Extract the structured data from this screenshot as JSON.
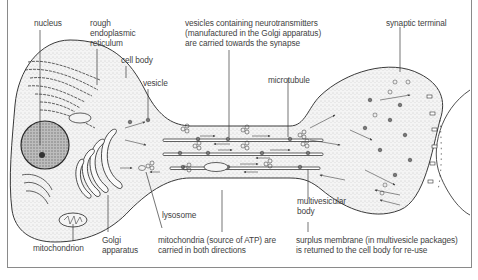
{
  "diagram": {
    "labels": {
      "nucleus": "nucleus",
      "rer_line1": "rough",
      "rer_line2": "endoplasmic",
      "rer_line3": "reticulum",
      "cell_body": "cell body",
      "vesicle": "vesicle",
      "vesicles_line1": "vesicles containing neurotransmitters",
      "vesicles_line2": "(manufactured in the Golgi apparatus)",
      "vesicles_line3": "are carried towards the synapse",
      "synaptic_terminal": "synaptic terminal",
      "microtubule": "microtubule",
      "lysosome": "lysosome",
      "multivesicular_line1": "multivesicular",
      "multivesicular_line2": "body",
      "mitochondrion": "mitochondrion",
      "golgi_line1": "Golgi",
      "golgi_line2": "apparatus",
      "mito_line1": "mitochondria (source of ATP) are",
      "mito_line2": "carried in both directions",
      "surplus_line1": "surplus membrane (in multivesicle packages)",
      "surplus_line2": "is returned to the cell body for re-use"
    },
    "colors": {
      "line": "#3a3a3a",
      "stipple": "#b8b8b8",
      "text": "#3f3f3f",
      "frame": "#8a8a8a"
    }
  }
}
